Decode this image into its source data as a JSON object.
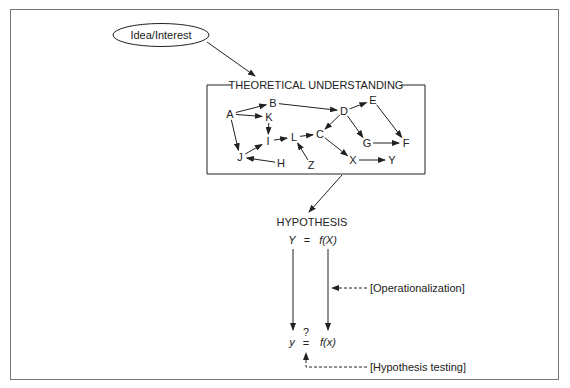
{
  "diagram": {
    "idea_label": "Idea/Interest",
    "theory_title": "THEORETICAL UNDERSTANDING",
    "hypothesis_title": "HYPOTHESIS",
    "theoretical_equation": {
      "lhs": "Y",
      "eq": "=",
      "rhs": "f(X)"
    },
    "empirical_equation": {
      "lhs": "y",
      "question": "?",
      "eq": "=",
      "rhs": "f(x)"
    },
    "operationalization_label": "[Operationalization]",
    "hypothesis_testing_label": "[Hypothesis testing]",
    "nodes": [
      {
        "id": "A",
        "x": 230,
        "y": 114
      },
      {
        "id": "B",
        "x": 273,
        "y": 103
      },
      {
        "id": "K",
        "x": 269,
        "y": 117
      },
      {
        "id": "I",
        "x": 268,
        "y": 141
      },
      {
        "id": "L",
        "x": 294,
        "y": 137
      },
      {
        "id": "J",
        "x": 240,
        "y": 157
      },
      {
        "id": "H",
        "x": 281,
        "y": 163
      },
      {
        "id": "Z",
        "x": 311,
        "y": 165
      },
      {
        "id": "C",
        "x": 320,
        "y": 134
      },
      {
        "id": "D",
        "x": 344,
        "y": 111
      },
      {
        "id": "E",
        "x": 373,
        "y": 100
      },
      {
        "id": "G",
        "x": 367,
        "y": 143
      },
      {
        "id": "F",
        "x": 406,
        "y": 143
      },
      {
        "id": "X",
        "x": 353,
        "y": 160
      },
      {
        "id": "Y",
        "x": 392,
        "y": 160
      }
    ],
    "edges": [
      [
        "A",
        "B"
      ],
      [
        "A",
        "K"
      ],
      [
        "A",
        "J"
      ],
      [
        "K",
        "I"
      ],
      [
        "J",
        "I"
      ],
      [
        "H",
        "J"
      ],
      [
        "I",
        "L"
      ],
      [
        "Z",
        "L"
      ],
      [
        "L",
        "C"
      ],
      [
        "B",
        "D"
      ],
      [
        "D",
        "E"
      ],
      [
        "D",
        "C"
      ],
      [
        "D",
        "G"
      ],
      [
        "E",
        "F"
      ],
      [
        "G",
        "F"
      ],
      [
        "C",
        "X"
      ],
      [
        "X",
        "Y"
      ]
    ]
  }
}
